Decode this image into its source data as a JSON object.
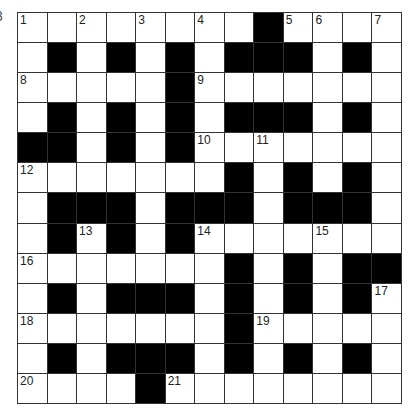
{
  "edge_glyph": "3",
  "crossword": {
    "rows": 13,
    "cols": 13,
    "layout": [
      "WWWWWWWWBWWWW",
      "WBWBWBWBBBWBW",
      "WWWWWBWWWWWWW",
      "WBWBWBWBBBWBW",
      "BBWBWBWWWWWWW",
      "WWWWWWWBWBWBW",
      "WBBBWBBBWBBBW",
      "WBWBWBWWWWWWW",
      "WWWWWWWBWBWBB",
      "WBWBBBWBWBWBW",
      "WWWWWWWBWWWWW",
      "WBWBBBWBWBWBW",
      "WWWWBWWWWWWWW"
    ],
    "numbers": [
      {
        "n": "1",
        "r": 0,
        "c": 0
      },
      {
        "n": "2",
        "r": 0,
        "c": 2
      },
      {
        "n": "3",
        "r": 0,
        "c": 4
      },
      {
        "n": "4",
        "r": 0,
        "c": 6
      },
      {
        "n": "5",
        "r": 0,
        "c": 9
      },
      {
        "n": "6",
        "r": 0,
        "c": 10
      },
      {
        "n": "7",
        "r": 0,
        "c": 12
      },
      {
        "n": "8",
        "r": 2,
        "c": 0
      },
      {
        "n": "9",
        "r": 2,
        "c": 6
      },
      {
        "n": "10",
        "r": 4,
        "c": 6
      },
      {
        "n": "11",
        "r": 4,
        "c": 8
      },
      {
        "n": "12",
        "r": 5,
        "c": 0
      },
      {
        "n": "13",
        "r": 7,
        "c": 2
      },
      {
        "n": "14",
        "r": 7,
        "c": 6
      },
      {
        "n": "15",
        "r": 7,
        "c": 10
      },
      {
        "n": "16",
        "r": 8,
        "c": 0
      },
      {
        "n": "17",
        "r": 9,
        "c": 12
      },
      {
        "n": "18",
        "r": 10,
        "c": 0
      },
      {
        "n": "19",
        "r": 10,
        "c": 8
      },
      {
        "n": "20",
        "r": 12,
        "c": 0
      },
      {
        "n": "21",
        "r": 12,
        "c": 5
      }
    ],
    "colors": {
      "block": "#000000",
      "cell": "#ffffff",
      "line": "#333333"
    }
  }
}
